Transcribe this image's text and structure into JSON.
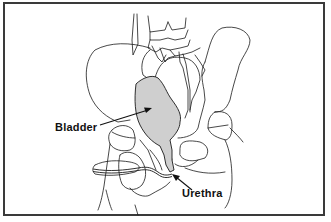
{
  "diagram": {
    "labels": [
      {
        "id": "bladder",
        "text": "Bladder"
      },
      {
        "id": "urethra",
        "text": "Urethra"
      }
    ],
    "colors": {
      "border": "#3a3a3a",
      "outline": "#1a1a1a",
      "bladder_fill": "#cfcfcf",
      "background": "#ffffff"
    }
  }
}
